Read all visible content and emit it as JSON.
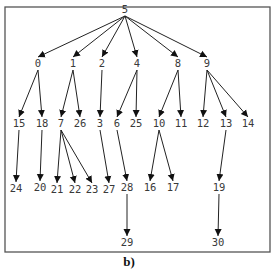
{
  "diagram": {
    "type": "tree",
    "caption": "b)",
    "frame": {
      "x": 5,
      "y": 7,
      "width": 265,
      "height": 245
    },
    "root": "5",
    "nodes": [
      {
        "id": "5",
        "x": 125,
        "y": 13
      },
      {
        "id": "0",
        "x": 38,
        "y": 67
      },
      {
        "id": "1",
        "x": 73,
        "y": 67
      },
      {
        "id": "2",
        "x": 102,
        "y": 67
      },
      {
        "id": "4",
        "x": 137,
        "y": 67
      },
      {
        "id": "8",
        "x": 178,
        "y": 67
      },
      {
        "id": "9",
        "x": 207,
        "y": 67
      },
      {
        "id": "15",
        "x": 19,
        "y": 127
      },
      {
        "id": "18",
        "x": 42,
        "y": 127
      },
      {
        "id": "7",
        "x": 61,
        "y": 127
      },
      {
        "id": "26",
        "x": 80,
        "y": 127
      },
      {
        "id": "3",
        "x": 100,
        "y": 127
      },
      {
        "id": "6",
        "x": 117,
        "y": 127
      },
      {
        "id": "25",
        "x": 136,
        "y": 127
      },
      {
        "id": "10",
        "x": 159,
        "y": 127
      },
      {
        "id": "11",
        "x": 181,
        "y": 127
      },
      {
        "id": "12",
        "x": 203,
        "y": 127
      },
      {
        "id": "13",
        "x": 226,
        "y": 127
      },
      {
        "id": "14",
        "x": 248,
        "y": 127
      },
      {
        "id": "24",
        "x": 16,
        "y": 192
      },
      {
        "id": "20",
        "x": 40,
        "y": 191
      },
      {
        "id": "21",
        "x": 57,
        "y": 193
      },
      {
        "id": "22",
        "x": 75,
        "y": 193
      },
      {
        "id": "23",
        "x": 92,
        "y": 193
      },
      {
        "id": "27",
        "x": 109,
        "y": 193
      },
      {
        "id": "28",
        "x": 127,
        "y": 191
      },
      {
        "id": "16",
        "x": 150,
        "y": 191
      },
      {
        "id": "17",
        "x": 173,
        "y": 191
      },
      {
        "id": "19",
        "x": 219,
        "y": 191
      },
      {
        "id": "29",
        "x": 127,
        "y": 246
      },
      {
        "id": "30",
        "x": 218,
        "y": 246
      }
    ],
    "edges": [
      {
        "from": "5",
        "to": "0"
      },
      {
        "from": "5",
        "to": "1"
      },
      {
        "from": "5",
        "to": "2"
      },
      {
        "from": "5",
        "to": "4"
      },
      {
        "from": "5",
        "to": "8"
      },
      {
        "from": "5",
        "to": "9"
      },
      {
        "from": "0",
        "to": "15"
      },
      {
        "from": "0",
        "to": "18"
      },
      {
        "from": "1",
        "to": "7"
      },
      {
        "from": "1",
        "to": "26"
      },
      {
        "from": "2",
        "to": "3"
      },
      {
        "from": "4",
        "to": "6"
      },
      {
        "from": "4",
        "to": "25"
      },
      {
        "from": "8",
        "to": "10"
      },
      {
        "from": "8",
        "to": "11"
      },
      {
        "from": "9",
        "to": "12"
      },
      {
        "from": "9",
        "to": "13"
      },
      {
        "from": "9",
        "to": "14"
      },
      {
        "from": "15",
        "to": "24"
      },
      {
        "from": "18",
        "to": "20"
      },
      {
        "from": "7",
        "to": "21"
      },
      {
        "from": "7",
        "to": "22"
      },
      {
        "from": "7",
        "to": "23"
      },
      {
        "from": "3",
        "to": "27"
      },
      {
        "from": "6",
        "to": "28"
      },
      {
        "from": "10",
        "to": "16"
      },
      {
        "from": "10",
        "to": "17"
      },
      {
        "from": "13",
        "to": "19"
      },
      {
        "from": "28",
        "to": "29"
      },
      {
        "from": "19",
        "to": "30"
      }
    ]
  }
}
